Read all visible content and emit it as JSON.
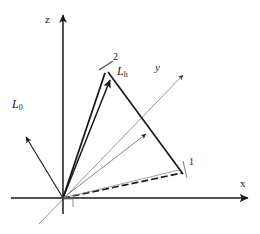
{
  "figure": {
    "type": "diagram",
    "title": "",
    "background_color": "#ffffff",
    "width": 260,
    "height": 234
  },
  "axes": {
    "origin": {
      "x": 63,
      "y": 198
    },
    "z": {
      "label": "z",
      "label_pos": {
        "x": 47,
        "y": 19
      },
      "from": {
        "x": 63,
        "y": 198
      },
      "to": {
        "x": 63,
        "y": 13
      },
      "color": "#1a1a1a",
      "arrow": true
    },
    "x": {
      "label": "x",
      "label_pos": {
        "x": 243,
        "y": 185
      },
      "from": {
        "x": 11,
        "y": 198
      },
      "to": {
        "x": 250,
        "y": 198
      },
      "color": "#1a1a1a",
      "arrow": true
    },
    "y": {
      "label": "y",
      "label_pos": {
        "x": 157,
        "y": 68
      },
      "from": {
        "x": 39,
        "y": 224
      },
      "to": {
        "x": 183,
        "y": 75
      },
      "color": "#8c8c8c",
      "arrow": true
    }
  },
  "vectors": [
    {
      "name": "L0",
      "label": "L",
      "sub": "0",
      "label_pos": {
        "x": 14,
        "y": 103
      },
      "from": {
        "x": 63,
        "y": 198
      },
      "to": {
        "x": 24,
        "y": 135
      },
      "color": "#1a1a1a",
      "width": 1.2,
      "arrow": true,
      "style": "solid"
    },
    {
      "name": "Lh",
      "label": "L",
      "sub": "h",
      "label_pos": {
        "x": 119,
        "y": 70
      },
      "from": {
        "x": 63,
        "y": 198
      },
      "to": {
        "x": 111,
        "y": 78
      },
      "color": "#1a1a1a",
      "width": 1.4,
      "arrow": true,
      "style": "solid"
    },
    {
      "name": "mid-ray",
      "label": "",
      "sub": "",
      "from": {
        "x": 63,
        "y": 198
      },
      "to": {
        "x": 146,
        "y": 134
      },
      "color": "#7a7a7a",
      "width": 0.9,
      "arrow": true,
      "style": "solid"
    },
    {
      "name": "lower-ray",
      "label": "",
      "sub": "",
      "from": {
        "x": 63,
        "y": 198
      },
      "to": {
        "x": 178,
        "y": 170
      },
      "color": "#7a7a7a",
      "width": 0.9,
      "arrow": false,
      "style": "solid"
    }
  ],
  "points": [
    {
      "name": "point-1",
      "label": "1",
      "label_pos": {
        "x": 186,
        "y": 162
      },
      "pos": {
        "x": 179,
        "y": 170
      },
      "tick": {
        "x1": 182,
        "y1": 163,
        "x2": 186,
        "y2": 177
      }
    },
    {
      "name": "point-2",
      "label": "2",
      "label_pos": {
        "x": 108,
        "y": 58
      },
      "pos": {
        "x": 107,
        "y": 75
      },
      "tick": {
        "x1": 101,
        "y1": 69,
        "x2": 112,
        "y2": 62
      }
    }
  ],
  "segments": [
    {
      "name": "edge-origin-to-2",
      "from": {
        "x": 63,
        "y": 198
      },
      "to": {
        "x": 105,
        "y": 72
      },
      "color": "#1a1a1a",
      "width": 1.6,
      "style": "solid"
    },
    {
      "name": "edge-2-to-1",
      "from": {
        "x": 108,
        "y": 72
      },
      "to": {
        "x": 182,
        "y": 173
      },
      "color": "#1a1a1a",
      "width": 1.6,
      "style": "solid"
    },
    {
      "name": "edge-origin-to-1-dashed",
      "from": {
        "x": 63,
        "y": 198
      },
      "to": {
        "x": 181,
        "y": 172
      },
      "color": "#1a1a1a",
      "width": 1.6,
      "style": "dashed"
    }
  ],
  "markers": {
    "right_angle": {
      "name": "right-angle-marker",
      "x": 64,
      "y": 199,
      "size": 9,
      "color": "#7a7a7a"
    }
  },
  "colors": {
    "ink": "#1a1a1a",
    "gray": "#7a7a7a",
    "light_gray": "#8c8c8c",
    "background": "#ffffff"
  }
}
